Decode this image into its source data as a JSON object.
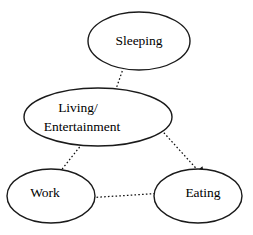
{
  "diagram": {
    "type": "state-transition-graph",
    "background_color": "#ffffff",
    "node_stroke_color": "#1a1a1a",
    "edge_color": "#111111",
    "text_color": "#000000",
    "nodes": [
      {
        "id": "sleeping",
        "label": "Sleeping",
        "label_lines": [
          "Sleeping"
        ],
        "cx": 139,
        "cy": 41,
        "rx": 51,
        "ry": 29
      },
      {
        "id": "living",
        "label": "Living/ Entertainment",
        "label_lines": [
          "Living/",
          "Entertainment"
        ],
        "cx": 98,
        "cy": 117,
        "rx": 74,
        "ry": 29
      },
      {
        "id": "work",
        "label": "Work",
        "label_lines": [
          "Work"
        ],
        "cx": 51,
        "cy": 196,
        "rx": 44,
        "ry": 27
      },
      {
        "id": "eating",
        "label": "Eating",
        "label_lines": [
          "Eating"
        ],
        "cx": 198,
        "cy": 196,
        "rx": 44,
        "ry": 27
      }
    ],
    "edges": [
      {
        "id": "sleeping-living",
        "from": "living",
        "to": "sleeping",
        "style": "dotted",
        "direction": "bidirectional",
        "x1": 108,
        "y1": 112,
        "x2": 131,
        "y2": 46
      },
      {
        "id": "work-living",
        "from": "work",
        "to": "living",
        "style": "dotted",
        "direction": "bidirectional",
        "x1": 55,
        "y1": 178,
        "x2": 90,
        "y2": 134
      },
      {
        "id": "living-eating",
        "from": "living",
        "to": "eating",
        "style": "dotted",
        "direction": "bidirectional",
        "x1": 146,
        "y1": 113,
        "x2": 203,
        "y2": 176
      },
      {
        "id": "work-eating",
        "from": "work",
        "to": "eating",
        "style": "dotted",
        "direction": "bidirectional",
        "x1": 70,
        "y1": 199,
        "x2": 180,
        "y2": 192
      }
    ]
  }
}
